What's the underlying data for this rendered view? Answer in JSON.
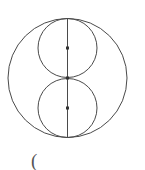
{
  "diagram": {
    "stroke_color": "#4a4a4a",
    "outer_circle": {
      "cx": 67.5,
      "cy": 78,
      "r": 59.5
    },
    "upper_circle": {
      "cx": 67.5,
      "cy": 48,
      "r": 29.5
    },
    "lower_circle": {
      "cx": 67.5,
      "cy": 108,
      "r": 29.5
    },
    "diameter_line": {
      "x1": 67.5,
      "y1": 18,
      "x2": 67.5,
      "y2": 138
    },
    "points": [
      {
        "name": "upper-center",
        "x": 67.5,
        "y": 48
      },
      {
        "name": "tangent-point",
        "x": 67.5,
        "y": 78
      },
      {
        "name": "lower-center",
        "x": 67.5,
        "y": 108
      }
    ],
    "caption": "("
  }
}
